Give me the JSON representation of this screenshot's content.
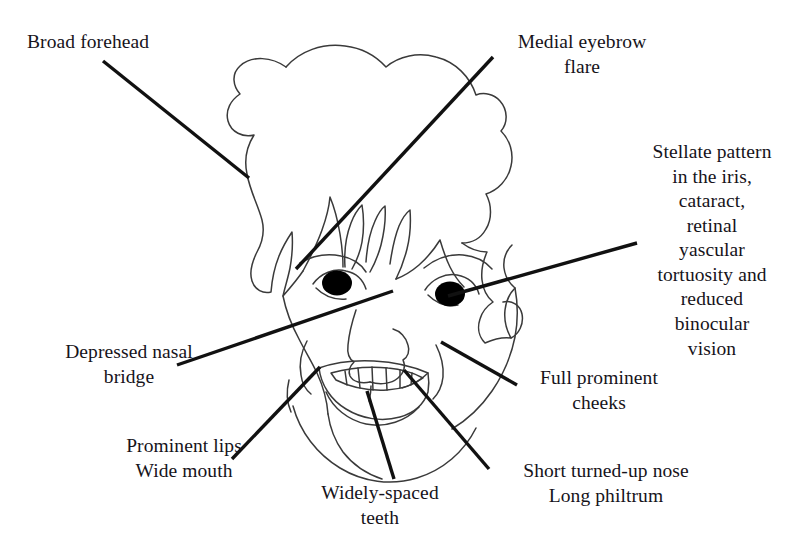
{
  "figure": {
    "background_color": "#ffffff",
    "ink_color": "#16131a",
    "outline_color": "#3a3a3a",
    "leader_color": "#111111"
  },
  "labels": {
    "broad_forehead": "Broad forehead",
    "medial_eyebrow_flare": "Medial eyebrow\nflare",
    "stellate_iris": "Stellate pattern\nin the iris,\ncataract,\nretinal\nyascular\ntortuosity and\nreduced\nbinocular\nvision",
    "depressed_nasal_bridge": "Depressed nasal\nbridge",
    "full_prominent_cheeks": "Full prominent\ncheeks",
    "prominent_lips_wide_mouth": "Prominent lips\nWide mouth",
    "widely_spaced_teeth": "Widely-spaced\nteeth",
    "short_nose_long_philtrum": "Short turned-up nose\nLong philtrum"
  },
  "leader_lines": [
    {
      "name": "broad-forehead-leader",
      "x1": 103,
      "y1": 61,
      "x2": 249,
      "y2": 178
    },
    {
      "name": "medial-eyebrow-flare-leader",
      "x1": 296,
      "y1": 269,
      "x2": 493,
      "y2": 57
    },
    {
      "name": "stellate-iris-leader",
      "x1": 448,
      "y1": 296,
      "x2": 637,
      "y2": 243
    },
    {
      "name": "depressed-nasal-bridge-leader",
      "x1": 177,
      "y1": 365,
      "x2": 393,
      "y2": 291
    },
    {
      "name": "full-prominent-cheeks-leader",
      "x1": 441,
      "y1": 342,
      "x2": 517,
      "y2": 385
    },
    {
      "name": "prominent-lips-leader",
      "x1": 232,
      "y1": 459,
      "x2": 320,
      "y2": 367
    },
    {
      "name": "widely-spaced-teeth-leader",
      "x1": 394,
      "y1": 479,
      "x2": 367,
      "y2": 391
    },
    {
      "name": "short-nose-leader",
      "x1": 489,
      "y1": 469,
      "x2": 404,
      "y2": 370
    }
  ],
  "face_parts": {
    "hair": "hair-outline",
    "face": "face-outline",
    "left_eye": "left-eye",
    "right_eye": "right-eye",
    "nose": "nose-outline",
    "mouth": "mouth-outline",
    "teeth": "teeth-row",
    "ear": "ear-outline",
    "chin": "chin-outline"
  }
}
